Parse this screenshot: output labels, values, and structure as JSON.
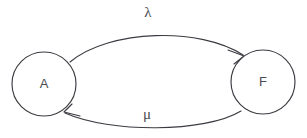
{
  "diagram": {
    "type": "state-transition-diagram",
    "title": "",
    "background_color": "#ffffff",
    "stroke_color": "#3b3b42",
    "text_color": "#4a4a50",
    "states": [
      {
        "id": "A",
        "label": "A",
        "cx": 44,
        "cy": 84,
        "r": 32
      },
      {
        "id": "F",
        "label": "F",
        "cx": 263,
        "cy": 82,
        "r": 32
      }
    ],
    "transitions": [
      {
        "id": "a-to-f",
        "from": "A",
        "to": "F",
        "label": "λ",
        "label_name": "lambda",
        "label_x": 148,
        "label_y": 14,
        "direction": "left-to-right",
        "curve": "arc-above"
      },
      {
        "id": "f-to-a",
        "from": "F",
        "to": "A",
        "label": "μ",
        "label_name": "mu",
        "label_x": 147,
        "label_y": 116,
        "direction": "right-to-left",
        "curve": "arc-below"
      }
    ]
  }
}
